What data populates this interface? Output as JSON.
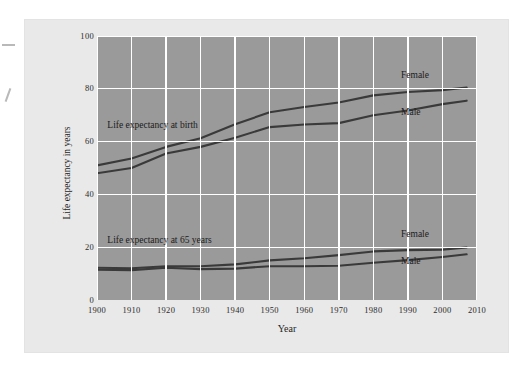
{
  "figure": {
    "background_color": "#e9e9e9",
    "plot_background_color": "#9a9a9a",
    "gridline_color": "#ffffff",
    "line_color": "#3a3a3a"
  },
  "chart_data": {
    "type": "line",
    "title": "",
    "xlabel": "Year",
    "ylabel": "Life expectancy in years",
    "xlim": [
      1900,
      2010
    ],
    "ylim": [
      0,
      100
    ],
    "xticks": [
      1900,
      1910,
      1920,
      1930,
      1940,
      1950,
      1960,
      1970,
      1980,
      1990,
      2000,
      2010
    ],
    "xtick_labels": [
      "1900",
      "1910",
      "1920",
      "1930",
      "1940",
      "1950",
      "1960",
      "1970",
      "1980",
      "1990",
      "2000",
      "2010"
    ],
    "yticks": [
      0,
      20,
      40,
      60,
      80,
      100
    ],
    "ytick_labels": [
      "0",
      "20",
      "40",
      "60",
      "80",
      "100"
    ],
    "grid": true,
    "legend_position": "inline-annotations",
    "annotations": [
      {
        "text": "Life expectancy at birth",
        "x": 1903,
        "y": 66
      },
      {
        "text": "Life expectancy at 65 years",
        "x": 1903,
        "y": 22.5
      },
      {
        "text": "Female",
        "x": 1988,
        "y": 85,
        "series": "birth-female"
      },
      {
        "text": "Male",
        "x": 1988,
        "y": 71,
        "series": "birth-male"
      },
      {
        "text": "Female",
        "x": 1988,
        "y": 24.5,
        "series": "age65-female"
      },
      {
        "text": "Male",
        "x": 1988,
        "y": 14.5,
        "series": "age65-male"
      }
    ],
    "x": [
      1900,
      1910,
      1920,
      1930,
      1940,
      1950,
      1960,
      1970,
      1980,
      1990,
      2000,
      2007
    ],
    "series": [
      {
        "name": "Life expectancy at birth, Female",
        "group": "Life expectancy at birth",
        "sex": "Female",
        "values": [
          51.0,
          53.6,
          58.0,
          61.3,
          66.6,
          71.1,
          73.1,
          74.8,
          77.5,
          78.8,
          79.5,
          80.5
        ]
      },
      {
        "name": "Life expectancy at birth, Male",
        "group": "Life expectancy at birth",
        "sex": "Male",
        "values": [
          48.0,
          50.0,
          55.5,
          58.0,
          61.5,
          65.5,
          66.5,
          67.0,
          70.0,
          71.8,
          74.2,
          75.5
        ]
      },
      {
        "name": "Life expectancy at 65 years, Female",
        "group": "Life expectancy at 65 years",
        "sex": "Female",
        "values": [
          12.2,
          12.0,
          12.8,
          12.8,
          13.5,
          15.0,
          15.8,
          17.0,
          18.4,
          18.9,
          19.1,
          19.9
        ]
      },
      {
        "name": "Life expectancy at 65 years, Male",
        "group": "Life expectancy at 65 years",
        "sex": "Male",
        "values": [
          11.5,
          11.3,
          12.2,
          11.7,
          11.9,
          12.8,
          12.8,
          13.0,
          14.1,
          15.1,
          16.3,
          17.3
        ]
      }
    ]
  }
}
